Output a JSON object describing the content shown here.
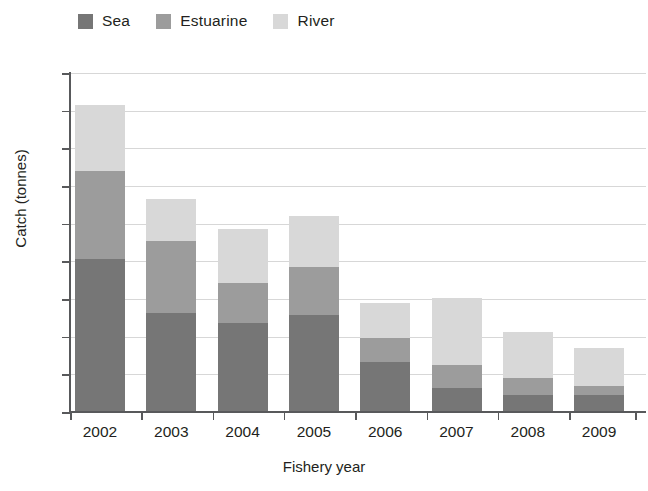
{
  "chart_data": {
    "type": "bar",
    "stacked": true,
    "title": "",
    "xlabel": "Fishery year",
    "ylabel": "Catch (tonnes)",
    "categories": [
      "2002",
      "2003",
      "2004",
      "2005",
      "2006",
      "2007",
      "2008",
      "2009"
    ],
    "series": [
      {
        "name": "Sea",
        "color": "#767676",
        "values": [
          40.5,
          26.3,
          23.7,
          25.8,
          13.3,
          6.5,
          4.6,
          4.4
        ]
      },
      {
        "name": "Estuarine",
        "color": "#9c9c9c",
        "values": [
          23.5,
          19.2,
          10.6,
          12.7,
          6.4,
          6.0,
          4.4,
          2.4
        ]
      },
      {
        "name": "River",
        "color": "#d8d8d8",
        "values": [
          17.5,
          11.0,
          14.2,
          13.5,
          9.3,
          17.8,
          12.3,
          10.2
        ]
      }
    ],
    "totals": [
      81.5,
      56.5,
      48.5,
      52.0,
      29.0,
      30.3,
      21.3,
      17.0
    ],
    "ylim": [
      0,
      90
    ],
    "ytick_labels": [
      "0",
      "10",
      "20",
      "30",
      "40",
      "50",
      "60",
      "70",
      "80",
      "90"
    ],
    "ytick_values": [
      0,
      10,
      20,
      30,
      40,
      50,
      60,
      70,
      80,
      90
    ],
    "grid": true,
    "legend_position": "top-left",
    "gridline_color": "#d7d7d7",
    "axis_color": "#58595b",
    "background_color": "#ffffff"
  },
  "legend": {
    "items": [
      {
        "label": "Sea"
      },
      {
        "label": "Estuarine"
      },
      {
        "label": "River"
      }
    ]
  }
}
